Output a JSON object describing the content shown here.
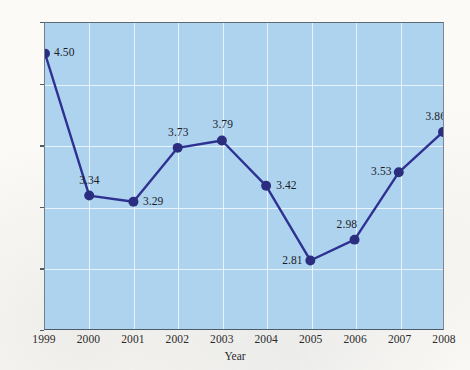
{
  "chart_data": {
    "type": "line",
    "title": "",
    "xlabel": "Year",
    "ylabel": "",
    "categories": [
      "1999",
      "2000",
      "2001",
      "2002",
      "2003",
      "2004",
      "2005",
      "2006",
      "2007",
      "2008"
    ],
    "x": [
      1999,
      2000,
      2001,
      2002,
      2003,
      2004,
      2005,
      2006,
      2007,
      2008
    ],
    "values": [
      4.5,
      3.34,
      3.29,
      3.73,
      3.79,
      3.42,
      2.81,
      2.98,
      3.53,
      3.86
    ],
    "point_labels": [
      "4.50",
      "3.34",
      "3.29",
      "3.73",
      "3.79",
      "3.42",
      "2.81",
      "2.98",
      "3.53",
      "3.86"
    ],
    "label_positions": [
      "right",
      "above",
      "right",
      "above",
      "above",
      "right",
      "left",
      "above-left",
      "left",
      "above-left"
    ],
    "ylim": [
      2.25,
      4.75
    ],
    "xlim": [
      1999,
      2008
    ],
    "yticks": [
      "4.75",
      "4.25",
      "3.75",
      "3.25",
      "2.75",
      "2.25"
    ],
    "ytick_values": [
      4.75,
      4.25,
      3.75,
      3.25,
      2.75,
      2.25
    ],
    "gridlines": {
      "horizontal": true,
      "vertical": true
    },
    "legend": null,
    "legend_position": "none",
    "colors": {
      "plot_background": "#aed3ef",
      "gridline": "#ffffff",
      "series_line": "#2e3191",
      "marker_fill": "#2b2d7f",
      "axis_border": "#4d5b68",
      "page_background": "#fbfaf7",
      "tick_label": "#2b2b2b"
    },
    "marker": "circle",
    "line_width_px": 2.4,
    "marker_radius_px": 5
  }
}
